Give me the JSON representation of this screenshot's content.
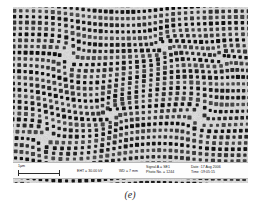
{
  "figure": {
    "caption": "(e)",
    "modality": "sem-micrograph"
  },
  "micrograph": {
    "background_color": "#d2d2d2",
    "dot_color": "#161616",
    "width_px": 235,
    "height_px": 176
  },
  "scale_bar": {
    "label": "1µm",
    "length_px": 42
  },
  "info_bar": {
    "eht": "EHT = 30.00 kV",
    "wd": "WD =  7 mm",
    "signal": "Signal A = SE1",
    "photo_no": "Photo No. = 1244",
    "date": "Date :17 Aug 2006",
    "time": "Time :19:05:15",
    "background_color": "#fdfdfd",
    "text_color": "#141414"
  },
  "pattern_data": {
    "type": "spiral-dot-lattice",
    "lattice_pitch_px": 6.1,
    "dot_radius_px": 1.95,
    "spiral_centers": [
      {
        "x": 54,
        "y": 46,
        "strength": 1.0
      },
      {
        "x": 150,
        "y": 38,
        "strength": -1.0
      },
      {
        "x": 96,
        "y": 104,
        "strength": -1.0
      },
      {
        "x": 182,
        "y": 112,
        "strength": 1.0
      },
      {
        "x": 32,
        "y": 128,
        "strength": 1.0
      },
      {
        "x": 206,
        "y": 54,
        "strength": -0.7
      }
    ],
    "swirl_amplitude": 0.55,
    "swirl_falloff_px": 62
  }
}
